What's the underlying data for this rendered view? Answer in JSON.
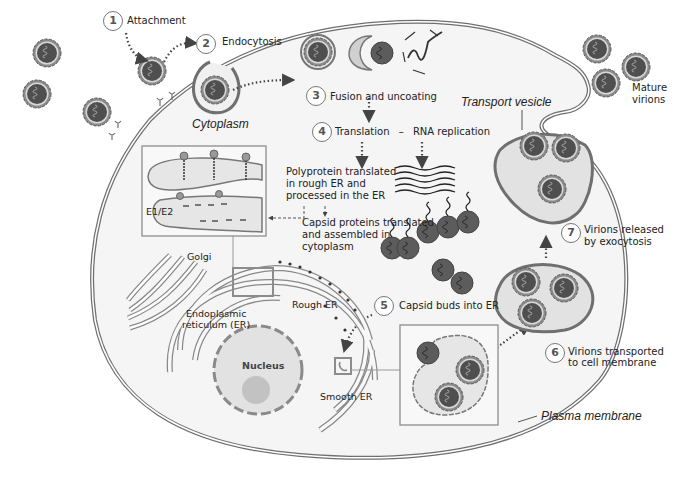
{
  "colors": {
    "membrane": "#6f6f6f",
    "cytoplasm": "#f6f6f6",
    "virion_core": "#555555",
    "virion_shell": "#8a8a8a",
    "vesicle_fill": "#e4e4e4",
    "nucleus_fill": "#e0e0e0",
    "nucleolus_fill": "#bdbdbd",
    "box_border": "#8c8c8c"
  },
  "steps": [
    {
      "number": "1",
      "label": "Attachment"
    },
    {
      "number": "2",
      "label": "Endocytosis"
    },
    {
      "number": "3",
      "label": "Fusion and uncoating"
    },
    {
      "number": "4",
      "label": "Translation",
      "separator": "–",
      "label2": "RNA replication"
    },
    {
      "number": "5",
      "label": "Capsid buds into ER"
    },
    {
      "number": "6",
      "label_line1": "Virions transported",
      "label_line2": "to cell membrane"
    },
    {
      "number": "7",
      "label_line1": "Virions released",
      "label_line2": "by exocytosis"
    }
  ],
  "labels": {
    "cytoplasm": "Cytoplasm",
    "transport_vesicle": "Transport vesicle",
    "mature_virions_line1": "Mature",
    "mature_virions_line2": "virions",
    "polyprotein_line1": "Polyprotein translated",
    "polyprotein_line2": "in rough ER and",
    "polyprotein_line3": "processed in the ER",
    "capsid_line1": "Capsid proteins translated",
    "capsid_line2": "and assembled in",
    "capsid_line3": "cytoplasm",
    "e1e2": "E1/E2",
    "golgi": "Golgi",
    "rough_er": "Rough ER",
    "er_line1": "Endoplasmic",
    "er_line2": "reticulum (ER)",
    "nucleus": "Nucleus",
    "smooth_er": "Smooth ER",
    "plasma_membrane": "Plasma membrane"
  },
  "icons": [
    "virion-icon",
    "capsid-icon",
    "rna-strand-icon",
    "arrow-icon",
    "nucleus-icon",
    "golgi-icon",
    "er-icon",
    "vesicle-icon"
  ]
}
